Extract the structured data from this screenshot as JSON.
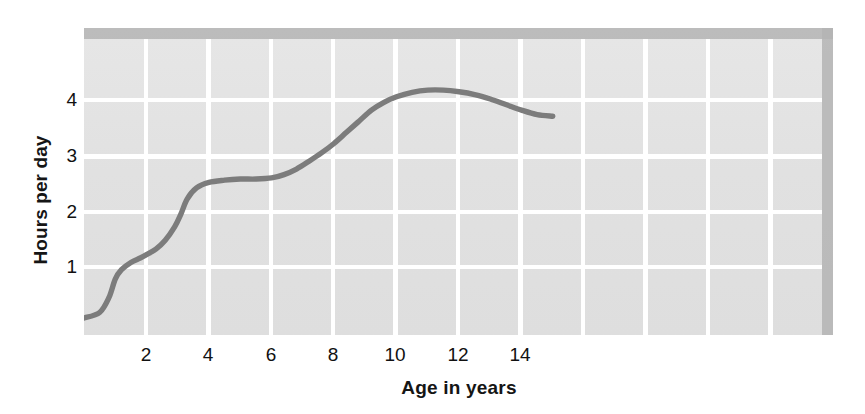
{
  "chart_data": {
    "type": "line",
    "title": "",
    "subtitle": "",
    "xlabel": "Age in years",
    "ylabel": "Hours per day",
    "xlim": [
      0,
      15.0
    ],
    "ylim": [
      0,
      4.9
    ],
    "xticks": [
      2,
      4,
      6,
      8,
      10,
      12,
      14
    ],
    "xticklabels": [
      "2",
      "4",
      "6",
      "8",
      "10",
      "12",
      "14"
    ],
    "yticks": [
      1,
      2,
      3,
      4
    ],
    "yticklabels": [
      "1",
      "2",
      "3",
      "4"
    ],
    "grid": true,
    "grid_color": "#ffffff",
    "plot_background": "#e2e2e2",
    "legend": null,
    "series": [
      {
        "name": "Hours per day",
        "color": "#7c7c7c",
        "linewidth": 5,
        "x": [
          0.0,
          0.5,
          0.8,
          1.0,
          1.2,
          1.5,
          1.8,
          2.0,
          2.3,
          2.6,
          2.9,
          3.1,
          3.3,
          3.6,
          4.0,
          4.5,
          5.0,
          5.5,
          6.0,
          6.4,
          6.8,
          7.2,
          7.6,
          8.0,
          8.4,
          8.8,
          9.2,
          9.6,
          10.0,
          10.5,
          11.0,
          11.5,
          12.0,
          12.5,
          13.0,
          13.5,
          14.0,
          14.5,
          15.0
        ],
        "y": [
          0.08,
          0.18,
          0.45,
          0.78,
          0.95,
          1.08,
          1.16,
          1.22,
          1.32,
          1.48,
          1.72,
          1.95,
          2.22,
          2.42,
          2.52,
          2.56,
          2.58,
          2.58,
          2.6,
          2.66,
          2.76,
          2.9,
          3.05,
          3.22,
          3.42,
          3.62,
          3.82,
          3.96,
          4.06,
          4.14,
          4.18,
          4.18,
          4.15,
          4.1,
          4.02,
          3.92,
          3.82,
          3.74,
          3.71
        ]
      }
    ]
  },
  "axes": {
    "y_title": "Hours per day",
    "x_title": "Age in years",
    "x_tick_labels": [
      "2",
      "4",
      "6",
      "8",
      "10",
      "12",
      "14"
    ],
    "y_tick_labels": [
      "1",
      "2",
      "3",
      "4"
    ]
  },
  "colors": {
    "curve": "#7c7c7c",
    "panel": "#e2e2e2",
    "grid": "#ffffff",
    "shadow": "#a8a8a8",
    "text": "#111111"
  }
}
